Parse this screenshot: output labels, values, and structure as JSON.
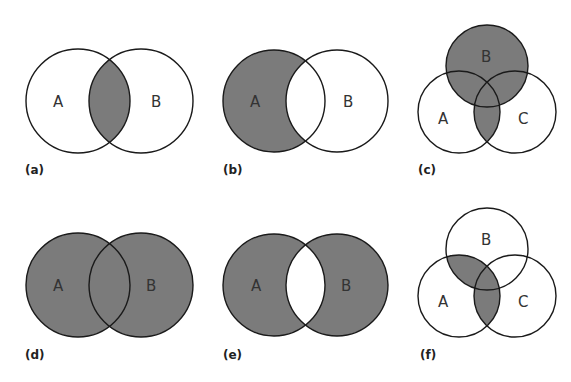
{
  "figure": {
    "shade_color": "#7b7b7b",
    "outline_color": "#1a1a1a",
    "background": "#ffffff",
    "panels": [
      {
        "id": "a",
        "label": "(a)",
        "sets": [
          "A",
          "B"
        ],
        "shaded_region": "A ∩ B"
      },
      {
        "id": "b",
        "label": "(b)",
        "sets": [
          "A",
          "B"
        ],
        "shaded_region": "A − B"
      },
      {
        "id": "c",
        "label": "(c)",
        "sets": [
          "A",
          "B",
          "C"
        ],
        "shaded_region": "B ∪ (A ∩ C)"
      },
      {
        "id": "d",
        "label": "(d)",
        "sets": [
          "A",
          "B"
        ],
        "shaded_region": "A ∪ B"
      },
      {
        "id": "e",
        "label": "(e)",
        "sets": [
          "A",
          "B"
        ],
        "shaded_region": "(A ∪ B) − (A ∩ B)"
      },
      {
        "id": "f",
        "label": "(f)",
        "sets": [
          "A",
          "B",
          "C"
        ],
        "shaded_region": "A ∩ (B ∪ C)"
      }
    ]
  }
}
